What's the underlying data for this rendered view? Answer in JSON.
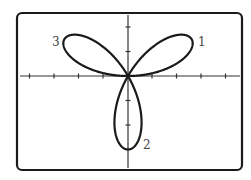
{
  "chart_data": {
    "type": "line",
    "subtype": "polar-rose",
    "title": "",
    "equation_shape": "three-leaved rose r = a sin(3θ)",
    "xlabel": "",
    "ylabel": "",
    "xlim": [
      -4.2,
      4.6
    ],
    "ylim": [
      -3.9,
      2.6
    ],
    "tick_spacing": 1,
    "x_ticks": [
      -4,
      -3,
      -2,
      -1,
      1,
      2,
      3,
      4
    ],
    "y_ticks": [
      -3,
      -2,
      -1,
      1,
      2
    ],
    "grid": false,
    "petals": [
      {
        "label": "1",
        "angle_deg": 30,
        "length": 3
      },
      {
        "label": "2",
        "angle_deg": 270,
        "length": 3
      },
      {
        "label": "3",
        "angle_deg": 150,
        "length": 3
      }
    ],
    "amplitude": 3,
    "frequency": 3
  },
  "labels": {
    "petal1": "1",
    "petal2": "2",
    "petal3": "3"
  },
  "colors": {
    "curve": "#1a1a1a",
    "axes": "#333333",
    "frame": "#1a1a1a",
    "background": "#ffffff",
    "label": "#444444"
  }
}
